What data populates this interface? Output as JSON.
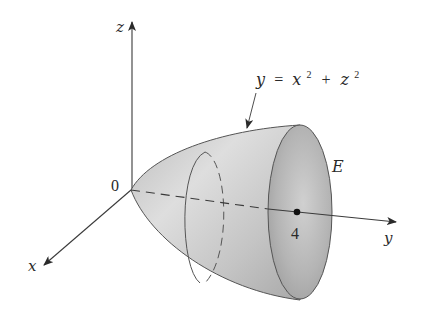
{
  "figure": {
    "axes": {
      "x_label": "x",
      "y_label": "y",
      "z_label": "z",
      "origin_label": "0"
    },
    "surface_equation": {
      "lhs": "y",
      "eq": "=",
      "x_var": "x",
      "x_exp": "2",
      "plus": "+",
      "z_var": "z",
      "z_exp": "2"
    },
    "region_label": "E",
    "tick_label": "4",
    "colors": {
      "axis": "#3a3a3a",
      "surface_light": "#e2e2e2",
      "surface_dark": "#a8a8a8",
      "outline": "#555555",
      "text": "#2a2a2a"
    }
  }
}
